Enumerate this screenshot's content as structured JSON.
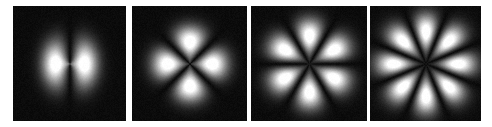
{
  "figure": {
    "panels": [
      {
        "id": "panel-1",
        "lobes": 2,
        "x": 13,
        "w": 113,
        "rotation_deg": 0
      },
      {
        "id": "panel-2",
        "lobes": 4,
        "x": 132,
        "w": 115,
        "rotation_deg": 45
      },
      {
        "id": "panel-3",
        "lobes": 6,
        "x": 251,
        "w": 116,
        "rotation_deg": 0
      },
      {
        "id": "panel-4",
        "lobes": 8,
        "x": 370,
        "w": 111,
        "rotation_deg": 22.5
      }
    ],
    "colors": {
      "background": "#0b0b0b",
      "lobe_peak": "#ffffff",
      "page": "#ffffff"
    }
  }
}
